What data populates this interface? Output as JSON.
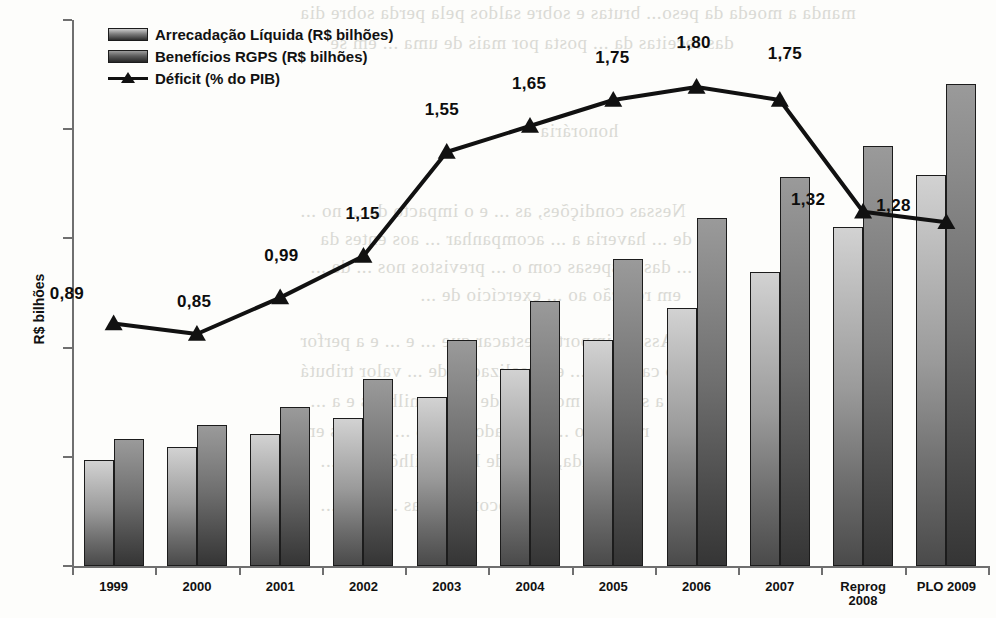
{
  "chart_data": {
    "type": "bar",
    "title": "",
    "subtitle": "",
    "xlabel": "",
    "ylabel": "R$ bilhões",
    "ylim": [
      0,
      250
    ],
    "yticks": [
      0,
      50,
      100,
      150,
      200,
      250
    ],
    "grid": false,
    "legend_position": "top-left",
    "categories": [
      "1999",
      "2000",
      "2001",
      "2002",
      "2003",
      "2004",
      "2005",
      "2006",
      "2007",
      "Reprog 2008",
      "PLO 2009"
    ],
    "category_lines": [
      [
        "1999"
      ],
      [
        "2000"
      ],
      [
        "2001"
      ],
      [
        "2002"
      ],
      [
        "2003"
      ],
      [
        "2004"
      ],
      [
        "2005"
      ],
      [
        "2006"
      ],
      [
        "2007"
      ],
      [
        "Reprog",
        "2008"
      ],
      [
        "PLO 2009"
      ]
    ],
    "series": [
      {
        "name": "Arrecadação Líquida (R$ bilhões)",
        "type": "bar",
        "axis": "left",
        "color": "#9a9a9a",
        "values": [
          48.5,
          54.5,
          60.5,
          68,
          77.5,
          90,
          103.5,
          118,
          134.5,
          155,
          179
        ]
      },
      {
        "name": "Benefícios RGPS (R$ bilhões)",
        "type": "bar",
        "axis": "left",
        "color": "#5d5d5d",
        "values": [
          58,
          64.5,
          73,
          85.5,
          103.5,
          121.5,
          140.5,
          159.5,
          178,
          192.5,
          220.5
        ]
      },
      {
        "name": "Déficit (% do PIB)",
        "type": "line",
        "axis": "right",
        "marker": "triangle",
        "color": "#111111",
        "values": [
          0.89,
          0.85,
          0.99,
          1.15,
          1.55,
          1.65,
          1.75,
          1.8,
          1.75,
          1.32,
          1.28
        ],
        "labels": [
          "0,89",
          "0,85",
          "0,99",
          "1,15",
          "1,55",
          "1,65",
          "1,75",
          "1,80",
          "1,75",
          "1,32",
          "1,28"
        ]
      }
    ]
  },
  "legend": {
    "items": [
      {
        "label": "Arrecadação Líquida (R$ bilhões)",
        "kind": "swatch-light"
      },
      {
        "label": "Benefícios RGPS (R$ bilhões)",
        "kind": "swatch-dark"
      },
      {
        "label": "Déficit (% do PIB)",
        "kind": "line-marker"
      }
    ]
  },
  "axes": {
    "y_title": "R$ bilhões",
    "y_tick_labels": [
      "250",
      "200",
      "150",
      "100",
      "50",
      "0"
    ]
  },
  "background_text": [
    "manda a moeda da peso...  brutas e sobre saldos pela  perda sobre dia",
    "das receitas da ...  posta  por mais de uma  ... em se",
    "honorária",
    "Nessas condições, as  ...  e o impacto  da  ...  no  ...",
    "de ... haveria  a   ...   acompanhar  ...  aos  entes  da",
    "... das despesas com o  ...  previstos  nos  ...  de  ...",
    "em relação ao  ... exercício de  ...",
    "Assim, importa  destacar  que  ...  e  ...  e  a  perfor",
    "no caso das  ...  e a  realização  de  ...  valor  tributá",
    "a se  ... no  montante de  R$  ...  milhões  e  a  ...",
    "resultado  ...  estimado   em   R$  ...  bilhões   em",
    "... ainda, do  ...  de  R$  ...  bilhões  em  ...",
    "... ocorrendo  as  ...  para  ..."
  ]
}
